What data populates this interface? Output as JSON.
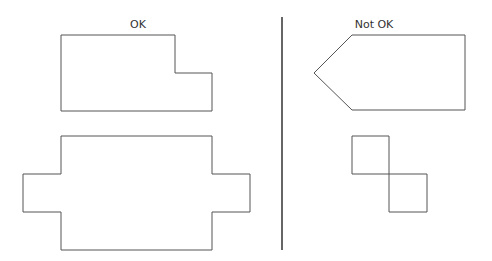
{
  "diagram": {
    "left_column": {
      "heading": "OK",
      "shapes": [
        {
          "name": "l-shaped-rectangle",
          "points": "61,35 175,35 175,73 212,73 212,111 61,111"
        },
        {
          "name": "cross-shaped-polygon",
          "points": "61,136 212,136 212,174 250,174 250,212 212,212 212,250 61,250 61,212 23,212 23,174 61,174"
        }
      ]
    },
    "right_column": {
      "heading": "Not OK",
      "shapes": [
        {
          "name": "arrow-pentagon",
          "points": "352,35 465,35 465,110 352,110 314,73"
        },
        {
          "name": "diagonal-squares",
          "points": "352,136 389,136 389,174 427,174 427,212 389,212 389,174 352,174"
        }
      ]
    },
    "colors": {
      "stroke": "#555555",
      "divider": "#333333",
      "text": "#333333"
    }
  }
}
